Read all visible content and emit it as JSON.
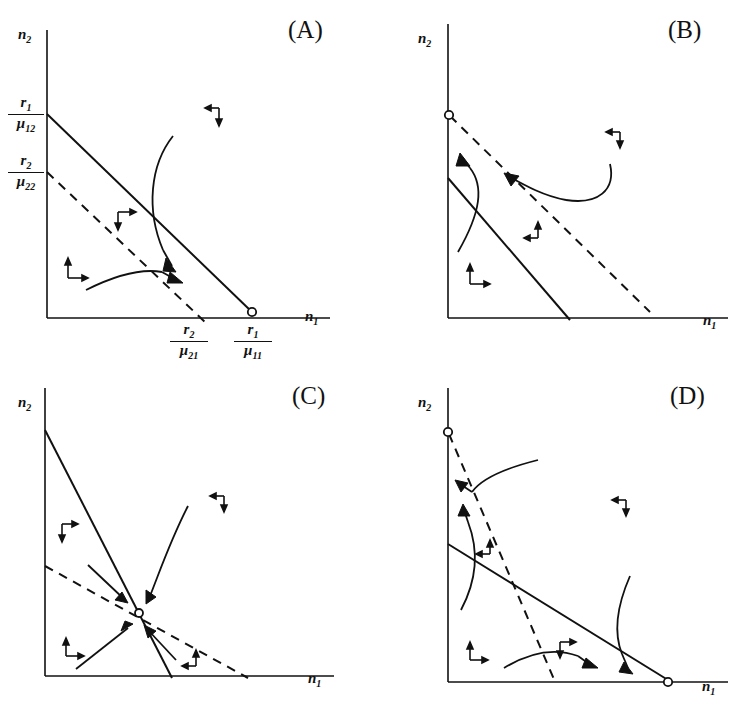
{
  "figure": {
    "type": "phase-plane-diagram-set",
    "background": "#ffffff",
    "ink": "#111111"
  },
  "panels": [
    {
      "tag": "(A)",
      "outcome": "species 1 wins",
      "xaxis_label": "n",
      "xaxis_sub": "1",
      "yaxis_label": "n",
      "yaxis_sub": "2",
      "solid_nullcline": {
        "style": "solid",
        "y_intercept_num": "r",
        "y_intercept_num_sub": "1",
        "y_intercept_den": "μ",
        "y_intercept_den_sub": "12",
        "x_intercept_num": "r",
        "x_intercept_num_sub": "1",
        "x_intercept_den": "μ",
        "x_intercept_den_sub": "11"
      },
      "dashed_nullcline": {
        "style": "dashed",
        "y_intercept_num": "r",
        "y_intercept_num_sub": "2",
        "y_intercept_den": "μ",
        "y_intercept_den_sub": "22",
        "x_intercept_num": "r",
        "x_intercept_num_sub": "2",
        "x_intercept_den": "μ",
        "x_intercept_den_sub": "21"
      },
      "equilibria": [
        {
          "on": "x-axis",
          "type": "open-circle",
          "stable": true
        }
      ],
      "direction_markers": [
        "left-down",
        "right-down",
        "up-right"
      ],
      "trajectories": 2
    },
    {
      "tag": "(B)",
      "outcome": "species 2 wins",
      "xaxis_label": "n",
      "xaxis_sub": "1",
      "yaxis_label": "n",
      "yaxis_sub": "2",
      "solid_nullcline": {
        "style": "solid"
      },
      "dashed_nullcline": {
        "style": "dashed"
      },
      "equilibria": [
        {
          "on": "y-axis",
          "type": "open-circle",
          "stable": true
        }
      ],
      "direction_markers": [
        "left-down",
        "left-up",
        "up-right"
      ],
      "trajectories": 2
    },
    {
      "tag": "(C)",
      "outcome": "stable coexistence",
      "xaxis_label": "n",
      "xaxis_sub": "1",
      "yaxis_label": "n",
      "yaxis_sub": "2",
      "solid_nullcline": {
        "style": "solid"
      },
      "dashed_nullcline": {
        "style": "dashed"
      },
      "equilibria": [
        {
          "on": "interior",
          "type": "open-circle",
          "stable": true
        }
      ],
      "direction_markers": [
        "right-down",
        "left-down",
        "up-right",
        "left-up"
      ],
      "trajectories": 4
    },
    {
      "tag": "(D)",
      "outcome": "bistability / founder control",
      "xaxis_label": "n",
      "xaxis_sub": "1",
      "yaxis_label": "n",
      "yaxis_sub": "2",
      "solid_nullcline": {
        "style": "solid"
      },
      "dashed_nullcline": {
        "style": "dashed"
      },
      "equilibria": [
        {
          "on": "y-axis",
          "type": "open-circle",
          "stable": true
        },
        {
          "on": "x-axis",
          "type": "open-circle",
          "stable": true
        }
      ],
      "direction_markers": [
        "left-down",
        "left-up",
        "up-right",
        "right-down"
      ],
      "trajectories": 4
    }
  ]
}
